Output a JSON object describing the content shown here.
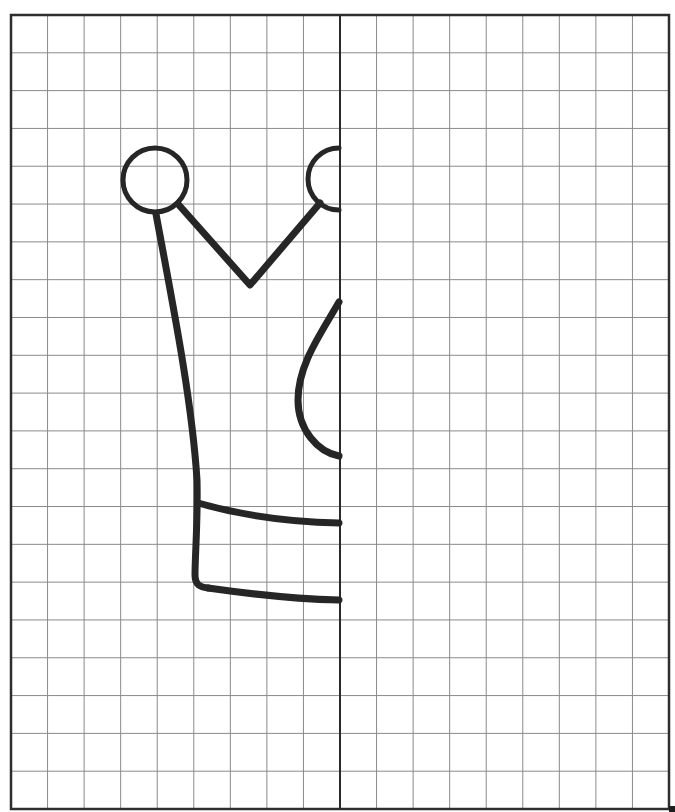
{
  "worksheet": {
    "title": "Symmetry drawing grid - crown",
    "instruction": "Complete the other half of the crown",
    "colors": {
      "background": "#ffffff",
      "grid_line": "#8a8a8a",
      "border": "#2e2e2e",
      "axis": "#2a2a2a",
      "drawing_stroke": "#262626"
    },
    "grid": {
      "left": 11,
      "top": 15,
      "right": 669,
      "bottom": 809,
      "columns": 18,
      "rows": 21,
      "axis_column": 9
    },
    "drawing": {
      "name": "crown-left-half",
      "stroke_width": 7
    },
    "artifact": {
      "x": 669,
      "y": 806,
      "width": 6,
      "height": 6
    }
  }
}
